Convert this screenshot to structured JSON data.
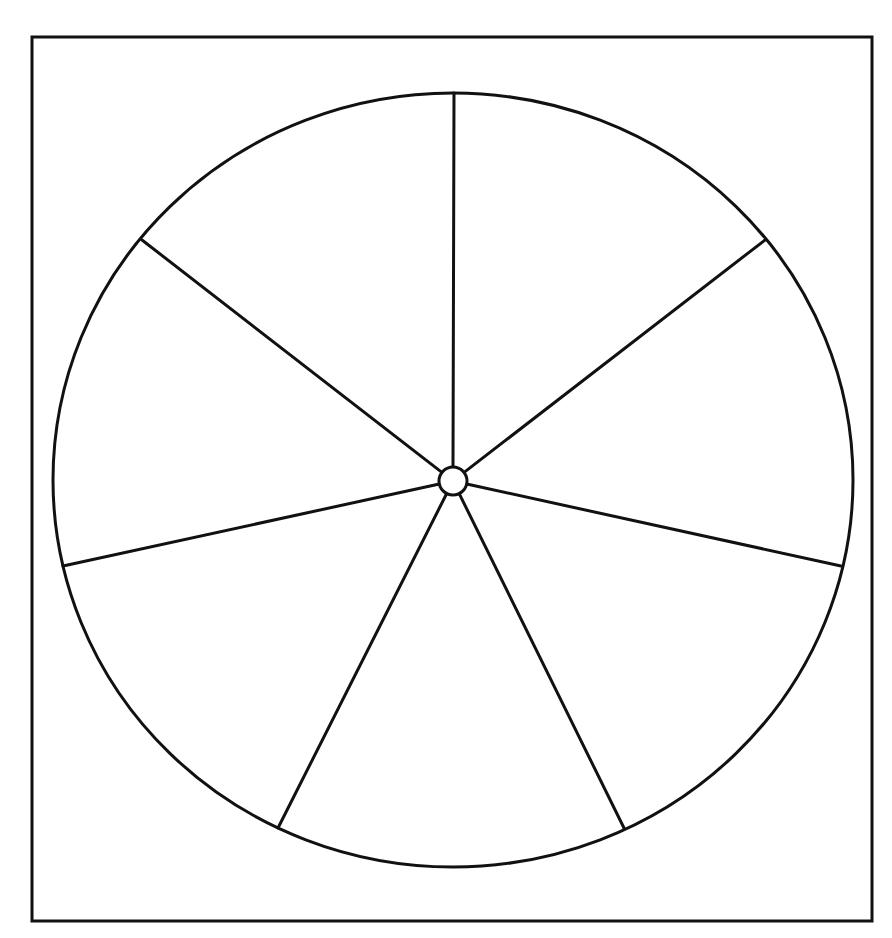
{
  "diagram": {
    "type": "blank-wheel-template",
    "section_count": 7,
    "colors": {
      "stroke": "#111111",
      "background": "#ffffff"
    },
    "frame": {
      "x": 32,
      "y": 37,
      "width": 840,
      "height": 884
    },
    "wheel": {
      "cx": 453,
      "cy": 480,
      "rx": 400,
      "ry": 387
    },
    "hub": {
      "cx": 453,
      "cy": 481,
      "r": 14
    },
    "spoke_endpoints": [
      {
        "name": "top",
        "x": 454,
        "y": 93
      },
      {
        "name": "upper-right",
        "x": 765,
        "y": 240
      },
      {
        "name": "right",
        "x": 841,
        "y": 566
      },
      {
        "name": "lower-right",
        "x": 624,
        "y": 828
      },
      {
        "name": "lower-left",
        "x": 278,
        "y": 828
      },
      {
        "name": "left",
        "x": 63,
        "y": 566
      },
      {
        "name": "upper-left",
        "x": 142,
        "y": 240
      }
    ],
    "sections": [
      {
        "label": ""
      },
      {
        "label": ""
      },
      {
        "label": ""
      },
      {
        "label": ""
      },
      {
        "label": ""
      },
      {
        "label": ""
      },
      {
        "label": ""
      }
    ]
  }
}
